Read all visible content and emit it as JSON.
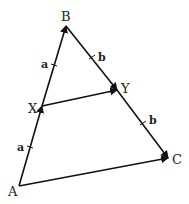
{
  "diagram": {
    "type": "vector-triangle",
    "points": {
      "A": {
        "label": "A",
        "x": 19,
        "y": 186
      },
      "B": {
        "label": "B",
        "x": 66,
        "y": 26
      },
      "C": {
        "label": "C",
        "x": 168,
        "y": 158
      },
      "X": {
        "label": "X",
        "x": 42,
        "y": 106
      },
      "Y": {
        "label": "Y",
        "x": 117,
        "y": 90
      }
    },
    "segment_labels": {
      "AX": "a",
      "XB": "a",
      "BY": "b",
      "YC": "b"
    },
    "arrows": [
      "A→X",
      "X→B",
      "B→Y",
      "Y→C",
      "A→C",
      "X→Y"
    ]
  }
}
